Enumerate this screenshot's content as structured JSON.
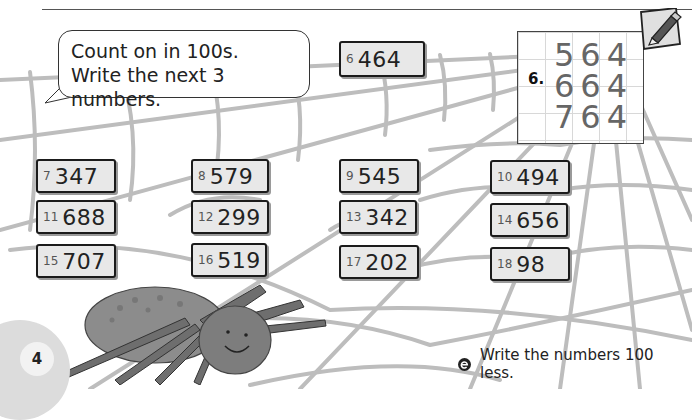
{
  "page": {
    "number": "4",
    "instruction_bubble": {
      "line1": "Count on in 100s.",
      "line2": "Write the next 3 numbers."
    },
    "example": {
      "label": "6.",
      "rows": [
        "564",
        "664",
        "764"
      ]
    },
    "extension": {
      "icon": "extension-e-icon",
      "text": "Write the numbers 100 less."
    },
    "questions": [
      {
        "n": "6",
        "value": "464"
      },
      {
        "n": "7",
        "value": "347"
      },
      {
        "n": "8",
        "value": "579"
      },
      {
        "n": "9",
        "value": "545"
      },
      {
        "n": "10",
        "value": "494"
      },
      {
        "n": "11",
        "value": "688"
      },
      {
        "n": "12",
        "value": "299"
      },
      {
        "n": "13",
        "value": "342"
      },
      {
        "n": "14",
        "value": "656"
      },
      {
        "n": "15",
        "value": "707"
      },
      {
        "n": "16",
        "value": "519"
      },
      {
        "n": "17",
        "value": "202"
      },
      {
        "n": "18",
        "value": "98"
      }
    ],
    "icons": {
      "pencil": "pencil-icon",
      "spider": "spider-illustration",
      "web": "spider-web-background"
    }
  }
}
